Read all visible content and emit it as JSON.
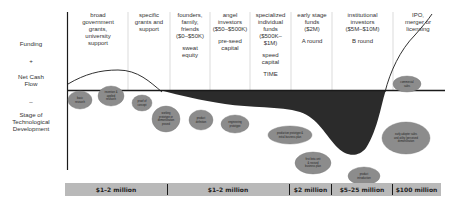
{
  "left_axis": {
    "funding": "Funding",
    "plus": "+",
    "net_cash_flow_1": "Net Cash",
    "net_cash_flow_2": "Flow",
    "minus": "–",
    "stage_1": "Stage of",
    "stage_2": "Technological",
    "stage_3": "Development"
  },
  "columns": [
    {
      "lines": [
        "broad",
        "government",
        "grants,",
        "university",
        "support"
      ]
    },
    {
      "lines": [
        "specific",
        "grants and",
        "support"
      ]
    },
    {
      "lines": [
        "founders,",
        "family,",
        "friends",
        "($0–$50K)",
        "",
        "sweat",
        "equity"
      ]
    },
    {
      "lines": [
        "angel",
        "investors",
        "($50–$500K)",
        "",
        "pre-seed",
        "capital"
      ]
    },
    {
      "lines": [
        "specialized",
        "individual",
        "funds",
        "($500K–",
        "$1M)",
        "",
        "speed",
        "capital",
        "",
        "TIME"
      ]
    },
    {
      "lines": [
        "early stage",
        "funds",
        "($2M)",
        "",
        "A round"
      ]
    },
    {
      "lines": [
        "institutional",
        "investors",
        "($5M–$10M)",
        "",
        "B round"
      ]
    },
    {
      "lines": [
        "IPO,",
        "merger or",
        "licensing"
      ]
    }
  ],
  "stages": [
    {
      "lines": [
        "basic",
        "research"
      ]
    },
    {
      "lines": [
        "invention &",
        "applied",
        "research"
      ]
    },
    {
      "lines": [
        "proof of",
        "concept"
      ]
    },
    {
      "lines": [
        "working",
        "prototype or",
        "demonstration",
        "proved"
      ]
    },
    {
      "lines": [
        "product",
        "definition"
      ]
    },
    {
      "lines": [
        "engineering",
        "prototype"
      ]
    },
    {
      "lines": [
        "production prototype &",
        "initial business plan"
      ]
    },
    {
      "lines": [
        "first beta unit",
        "& revised",
        "business plan"
      ]
    },
    {
      "lines": [
        "product",
        "introduction"
      ]
    },
    {
      "lines": [
        "early adopter sales",
        "and utility (perceived",
        "demonstration"
      ]
    },
    {
      "lines": [
        "commercial",
        "sales"
      ]
    }
  ],
  "funding_bar": {
    "segments": [
      "$1–2 million",
      "$1–2 million",
      "$2 million",
      "$5–25 million",
      "$100 million"
    ]
  },
  "colors": {
    "valley": "#2b2b2b",
    "bubble": "#8c8c8c",
    "bubble_stroke": "#777777",
    "bar": "#b9b9b9",
    "axis": "#1a1a1a",
    "divider": "#bbbbbb"
  }
}
